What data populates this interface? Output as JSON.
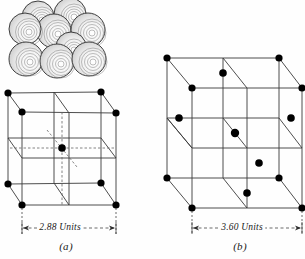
{
  "figure": {
    "background_color": "#fefefe",
    "line_color": "#3a3a3a",
    "dash_color": "#555555",
    "atom_color": "#000000",
    "text_color": "#1a1a1a",
    "sphere_fill": "#f5f5f5",
    "sphere_stroke": "#2b2b2b"
  },
  "sphere_cluster": {
    "name": "bcc-sphere-packing-model",
    "sphere_count": 9,
    "description": "Nine shaded spheres in body-centered cubic packing, engraved concentric-arc shading",
    "spheres": [
      {
        "cx": 38,
        "cy": 17,
        "r": 16,
        "row": "back-top"
      },
      {
        "cx": 70,
        "cy": 14,
        "r": 16,
        "row": "back-top"
      },
      {
        "cx": 54,
        "cy": 30,
        "r": 17,
        "row": "mid-top"
      },
      {
        "cx": 24,
        "cy": 28,
        "r": 16,
        "row": "front-top"
      },
      {
        "cx": 88,
        "cy": 29,
        "r": 17,
        "row": "front-top"
      },
      {
        "cx": 71,
        "cy": 46,
        "r": 15,
        "row": "center"
      },
      {
        "cx": 26,
        "cy": 58,
        "r": 17,
        "row": "front-bottom"
      },
      {
        "cx": 57,
        "cy": 60,
        "r": 17,
        "row": "front-bottom"
      },
      {
        "cx": 89,
        "cy": 58,
        "r": 17,
        "row": "front-bottom"
      }
    ]
  },
  "cell_a": {
    "name": "body-centered-cubic-cell",
    "caption": "(a)",
    "dimension_label": "2.88 Units",
    "structure_type": "bcc",
    "atom_count": 9,
    "corner_atoms": 8,
    "center_atoms": 1,
    "atoms": [
      {
        "x": 8,
        "y": 93,
        "pos": "back-top-left"
      },
      {
        "x": 101,
        "y": 92,
        "pos": "back-top-right"
      },
      {
        "x": 22,
        "y": 112,
        "pos": "front-top-left"
      },
      {
        "x": 116,
        "y": 113,
        "pos": "front-top-right"
      },
      {
        "x": 8,
        "y": 184,
        "pos": "back-bottom-left"
      },
      {
        "x": 101,
        "y": 183,
        "pos": "back-bottom-right"
      },
      {
        "x": 22,
        "y": 205,
        "pos": "front-bottom-left"
      },
      {
        "x": 116,
        "y": 205,
        "pos": "front-bottom-right"
      },
      {
        "x": 62,
        "y": 148,
        "pos": "body-center"
      }
    ]
  },
  "cell_b": {
    "name": "face-centered-cubic-cell",
    "caption": "(b)",
    "dimension_label": "3.60 Units",
    "structure_type": "fcc",
    "atom_count": 14,
    "corner_atoms": 8,
    "face_atoms": 6,
    "atoms": [
      {
        "x": 167,
        "y": 58,
        "pos": "back-top-left"
      },
      {
        "x": 279,
        "y": 58,
        "pos": "back-top-right"
      },
      {
        "x": 192,
        "y": 88,
        "pos": "front-top-left"
      },
      {
        "x": 302,
        "y": 88,
        "pos": "front-top-right"
      },
      {
        "x": 167,
        "y": 178,
        "pos": "back-bottom-left"
      },
      {
        "x": 279,
        "y": 178,
        "pos": "back-bottom-right"
      },
      {
        "x": 192,
        "y": 208,
        "pos": "front-bottom-left"
      },
      {
        "x": 302,
        "y": 208,
        "pos": "front-bottom-right"
      },
      {
        "x": 223,
        "y": 73,
        "pos": "top-face-center"
      },
      {
        "x": 247,
        "y": 193,
        "pos": "bottom-face-center"
      },
      {
        "x": 179,
        "y": 118,
        "pos": "left-face-center"
      },
      {
        "x": 291,
        "y": 118,
        "pos": "right-face-center"
      },
      {
        "x": 235,
        "y": 133,
        "pos": "back-face-center"
      },
      {
        "x": 259,
        "y": 163,
        "pos": "front-face-center"
      }
    ]
  }
}
